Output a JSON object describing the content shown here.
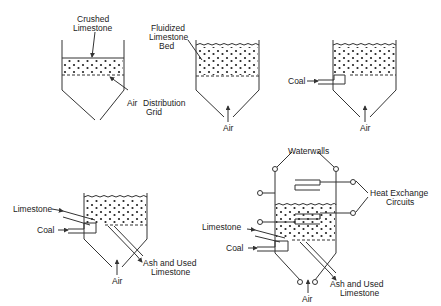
{
  "diagram": {
    "type": "process-schematic",
    "panels": [
      {
        "id": "panel-1",
        "labels": [
          "Crushed Limestone",
          "Air Distribution Grid"
        ]
      },
      {
        "id": "panel-2",
        "labels": [
          "Fluidized Limestone Bed",
          "Air"
        ]
      },
      {
        "id": "panel-3",
        "labels": [
          "Coal",
          "Air"
        ]
      },
      {
        "id": "panel-4",
        "labels": [
          "Limestone",
          "Coal",
          "Air",
          "Ash and Used Limestone"
        ]
      },
      {
        "id": "panel-5",
        "labels": [
          "Waterwalls",
          "Heat Exchange Circuits",
          "Limestone",
          "Coal",
          "Air",
          "Ash and Used Limestone"
        ]
      }
    ]
  },
  "labels": {
    "p1_crushed": "Crushed",
    "p1_limestone": "Limestone",
    "p1_air": "Air",
    "p1_distribution": "Distribution",
    "p1_grid": "Grid",
    "p2_fluidized": "Fluidized",
    "p2_limestone": "Limestone",
    "p2_bed": "Bed",
    "p2_air": "Air",
    "p3_coal": "Coal",
    "p3_air": "Air",
    "p4_limestone": "Limestone",
    "p4_coal": "Coal",
    "p4_air": "Air",
    "p4_ash1": "Ash and Used",
    "p4_ash2": "Limestone",
    "p5_waterwalls": "Waterwalls",
    "p5_heat1": "Heat Exchange",
    "p5_heat2": "Circuits",
    "p5_limestone": "Limestone",
    "p5_coal": "Coal",
    "p5_air": "Air",
    "p5_ash1": "Ash and Used",
    "p5_ash2": "Limestone"
  }
}
